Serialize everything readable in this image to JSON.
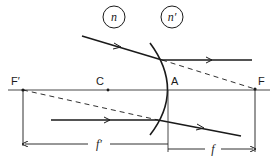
{
  "diagram": {
    "type": "refraction-at-spherical-surface",
    "labels": {
      "medium_left": "n",
      "medium_right": "n′",
      "focal_point_left": "F′",
      "center": "C",
      "vertex": "A",
      "focal_point_right": "F",
      "focal_length_left": "f′",
      "focal_length_right": "f"
    },
    "colors": {
      "line": "#1a1a1a",
      "axis": "#333333",
      "background": "#ffffff"
    }
  }
}
